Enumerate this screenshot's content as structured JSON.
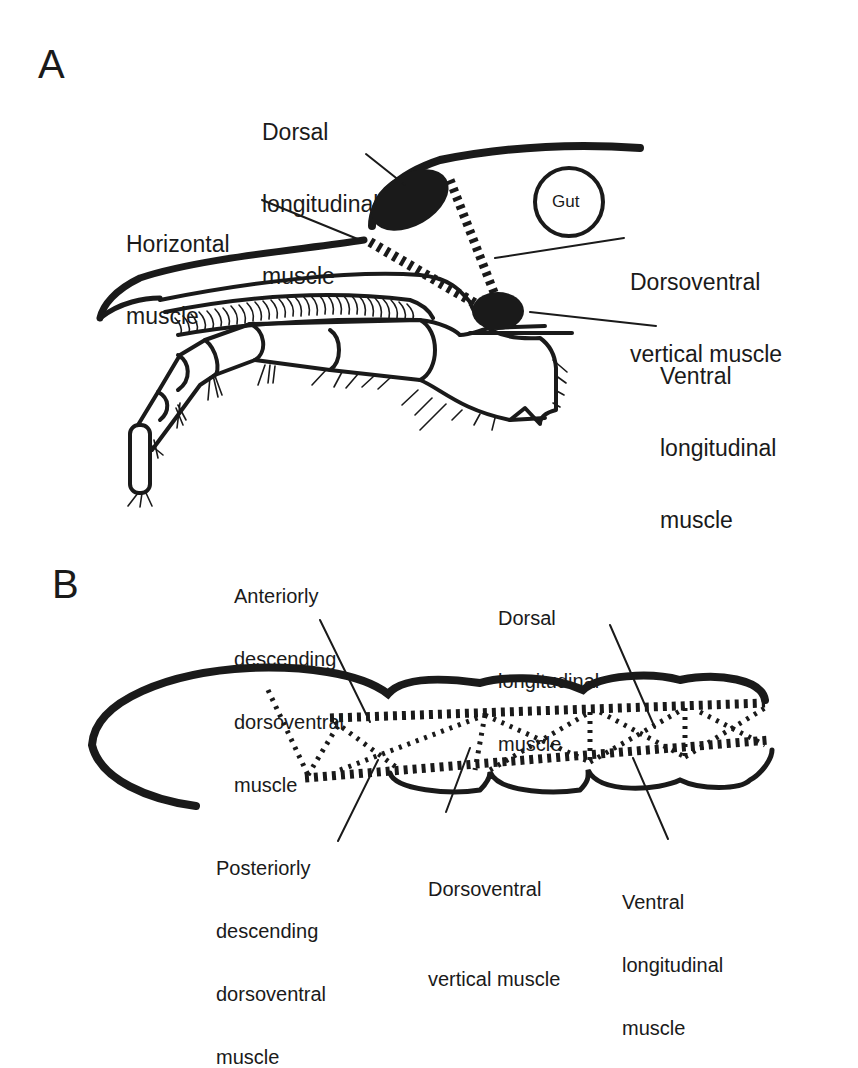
{
  "figure": {
    "panels": [
      {
        "id": "A",
        "letter": "A",
        "labels": {
          "dorsal_longitudinal": [
            "Dorsal",
            "longitudinal",
            "muscle"
          ],
          "horizontal": [
            "Horizontal",
            "muscle"
          ],
          "gut": "Gut",
          "dorsoventral_vertical": [
            "Dorsoventral",
            "vertical muscle"
          ],
          "ventral_longitudinal": [
            "Ventral",
            "longitudinal",
            "muscle"
          ]
        }
      },
      {
        "id": "B",
        "letter": "B",
        "labels": {
          "anteriorly_descending": [
            "Anteriorly",
            "descending",
            "dorsoventral",
            "muscle"
          ],
          "dorsal_longitudinal": [
            "Dorsal",
            "longitudinal",
            "muscle"
          ],
          "posteriorly_descending": [
            "Posteriorly",
            "descending",
            "dorsoventral",
            "muscle"
          ],
          "dorsoventral_vertical": [
            "Dorsoventral",
            "vertical muscle"
          ],
          "ventral_longitudinal": [
            "Ventral",
            "longitudinal",
            "muscle"
          ]
        }
      }
    ],
    "colors": {
      "ink": "#1a1a1a",
      "background": "#ffffff"
    }
  }
}
